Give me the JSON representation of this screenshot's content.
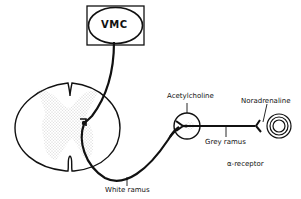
{
  "diagram": {
    "type": "sympathetic-pathway",
    "nodes": {
      "vmc": {
        "label": "VMC"
      },
      "spinal_cord": {
        "label": ""
      },
      "ganglion": {
        "label": "Acetylcholine"
      },
      "effector": {
        "label": "Noradrenaline"
      }
    },
    "labels": {
      "white_ramus": "White ramus",
      "grey_ramus": "Grey ramus",
      "receptor": "α-receptor"
    },
    "edges": [
      {
        "from": "vmc",
        "to": "spinal_cord"
      },
      {
        "from": "spinal_cord",
        "to": "ganglion",
        "label": "White ramus"
      },
      {
        "from": "ganglion",
        "to": "effector",
        "label": "Grey ramus"
      }
    ],
    "colors": {
      "line": "#111111",
      "stipple": "#9a9a9a",
      "background": "#ffffff"
    }
  }
}
